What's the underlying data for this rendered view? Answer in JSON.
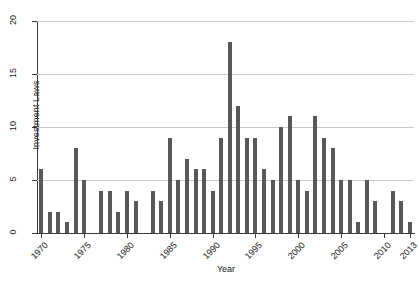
{
  "chart_data": {
    "type": "bar",
    "title": "",
    "xlabel": "Year",
    "ylabel": "Investment Laws",
    "xlim": [
      1969.5,
      2013.5
    ],
    "ylim": [
      0,
      20
    ],
    "yticks": [
      0,
      5,
      10,
      15,
      20
    ],
    "xticks": [
      1970,
      1975,
      1980,
      1985,
      1990,
      1995,
      2000,
      2005,
      2010,
      2013
    ],
    "grid": "horizontal",
    "legend": "none",
    "bar_color": "#595959",
    "categories": [
      "1970",
      "1971",
      "1972",
      "1973",
      "1974",
      "1975",
      "1976",
      "1977",
      "1978",
      "1979",
      "1980",
      "1981",
      "1982",
      "1983",
      "1984",
      "1985",
      "1986",
      "1987",
      "1988",
      "1989",
      "1990",
      "1991",
      "1992",
      "1993",
      "1994",
      "1995",
      "1996",
      "1997",
      "1998",
      "1999",
      "2000",
      "2001",
      "2002",
      "2003",
      "2004",
      "2005",
      "2006",
      "2007",
      "2008",
      "2009",
      "2010",
      "2011",
      "2012",
      "2013"
    ],
    "values": [
      6,
      2,
      2,
      1,
      8,
      5,
      0,
      4,
      4,
      2,
      4,
      3,
      0,
      4,
      3,
      9,
      5,
      7,
      6,
      6,
      4,
      9,
      18,
      12,
      9,
      9,
      6,
      5,
      10,
      11,
      5,
      4,
      11,
      9,
      8,
      5,
      5,
      1,
      5,
      3,
      0,
      4,
      3,
      1
    ]
  }
}
